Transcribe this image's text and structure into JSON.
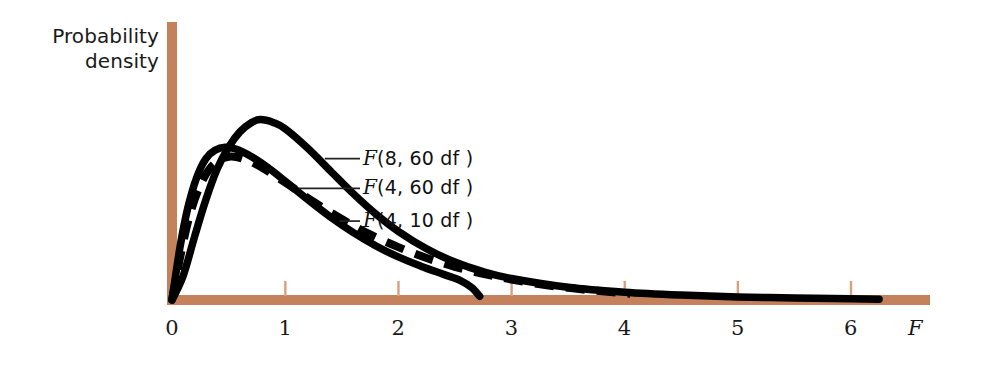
{
  "figure": {
    "background_color": "#ffffff",
    "axis_color": "#c4815c",
    "tick_color": "#d9a07e",
    "curve_color": "#000000",
    "leader_color": "#222222"
  },
  "axes": {
    "y_label_line1": "Probability",
    "y_label_line2": "density",
    "x_label": "F",
    "x_ticks": [
      "0",
      "1",
      "2",
      "3",
      "4",
      "5",
      "6"
    ]
  },
  "labels": [
    {
      "id": "f8-60",
      "prefix": "F",
      "rest": "(8, 60 df )"
    },
    {
      "id": "f4-60",
      "prefix": "F",
      "rest": "(4, 60 df )"
    },
    {
      "id": "f4-10",
      "prefix": "F",
      "rest": "(4, 10 df )"
    }
  ],
  "chart_data": {
    "type": "line",
    "title": "",
    "xlabel": "F",
    "ylabel": "Probability density",
    "xlim": [
      0,
      6.7
    ],
    "ylim": [
      0,
      1.0
    ],
    "grid": false,
    "legend_position": "inline-callout",
    "x_ticks": [
      0,
      1,
      2,
      3,
      4,
      5,
      6
    ],
    "y_ticks": [],
    "series": [
      {
        "name": "F(8, 60 df)",
        "style": "solid",
        "color": "#000000",
        "peak_x": 0.78,
        "peak_y": 0.88,
        "x_end": 6.25,
        "points": [
          [
            0.0,
            0.0
          ],
          [
            0.1,
            0.12
          ],
          [
            0.2,
            0.31
          ],
          [
            0.3,
            0.49
          ],
          [
            0.4,
            0.64
          ],
          [
            0.5,
            0.745
          ],
          [
            0.6,
            0.82
          ],
          [
            0.7,
            0.865
          ],
          [
            0.78,
            0.88
          ],
          [
            0.9,
            0.865
          ],
          [
            1.0,
            0.835
          ],
          [
            1.2,
            0.74
          ],
          [
            1.4,
            0.63
          ],
          [
            1.6,
            0.52
          ],
          [
            1.8,
            0.42
          ],
          [
            2.0,
            0.335
          ],
          [
            2.25,
            0.25
          ],
          [
            2.5,
            0.185
          ],
          [
            2.75,
            0.138
          ],
          [
            3.0,
            0.105
          ],
          [
            3.5,
            0.062
          ],
          [
            4.0,
            0.038
          ],
          [
            4.5,
            0.024
          ],
          [
            5.0,
            0.015
          ],
          [
            5.5,
            0.01
          ],
          [
            6.0,
            0.006
          ],
          [
            6.25,
            0.004
          ]
        ]
      },
      {
        "name": "F(4, 60 df)",
        "style": "dashed",
        "color": "#000000",
        "peak_x": 0.52,
        "peak_y": 0.7,
        "x_end": 4.05,
        "points": [
          [
            0.0,
            0.0
          ],
          [
            0.08,
            0.23
          ],
          [
            0.16,
            0.42
          ],
          [
            0.25,
            0.56
          ],
          [
            0.34,
            0.645
          ],
          [
            0.43,
            0.685
          ],
          [
            0.52,
            0.7
          ],
          [
            0.62,
            0.69
          ],
          [
            0.75,
            0.66
          ],
          [
            0.9,
            0.61
          ],
          [
            1.05,
            0.555
          ],
          [
            1.25,
            0.48
          ],
          [
            1.5,
            0.395
          ],
          [
            1.75,
            0.32
          ],
          [
            2.0,
            0.258
          ],
          [
            2.25,
            0.205
          ],
          [
            2.5,
            0.162
          ],
          [
            2.75,
            0.128
          ],
          [
            3.0,
            0.1
          ],
          [
            3.3,
            0.073
          ],
          [
            3.6,
            0.053
          ],
          [
            3.85,
            0.04
          ],
          [
            4.05,
            0.031
          ]
        ]
      },
      {
        "name": "F(4, 10 df)",
        "style": "solid",
        "color": "#000000",
        "peak_x": 0.47,
        "peak_y": 0.745,
        "x_end": 2.72,
        "points": [
          [
            0.0,
            0.0
          ],
          [
            0.07,
            0.255
          ],
          [
            0.14,
            0.45
          ],
          [
            0.22,
            0.6
          ],
          [
            0.3,
            0.69
          ],
          [
            0.38,
            0.73
          ],
          [
            0.47,
            0.745
          ],
          [
            0.57,
            0.735
          ],
          [
            0.7,
            0.7
          ],
          [
            0.85,
            0.645
          ],
          [
            1.0,
            0.58
          ],
          [
            1.2,
            0.49
          ],
          [
            1.4,
            0.405
          ],
          [
            1.6,
            0.33
          ],
          [
            1.8,
            0.265
          ],
          [
            2.0,
            0.21
          ],
          [
            2.2,
            0.165
          ],
          [
            2.4,
            0.125
          ],
          [
            2.55,
            0.095
          ],
          [
            2.65,
            0.06
          ],
          [
            2.72,
            0.018
          ]
        ]
      }
    ],
    "annotations": [
      {
        "text": "F(8, 60 df )",
        "attach_x": 1.35,
        "attach_y": 0.69
      },
      {
        "text": "F(4, 60 df )",
        "attach_x": 1.12,
        "attach_y": 0.545
      },
      {
        "text": "F(4, 10 df )",
        "attach_x": 1.48,
        "attach_y": 0.385
      }
    ]
  }
}
